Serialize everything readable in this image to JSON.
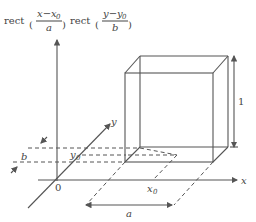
{
  "formula": {
    "func1": "rect",
    "num1": "x−x",
    "num1_sub": "0",
    "den1": "a",
    "func2": "rect",
    "num2": "y−y",
    "num2_sub": "0",
    "den2": "b"
  },
  "axes": {
    "x_label": "x",
    "y_label": "y",
    "origin_label": "0"
  },
  "labels": {
    "x0": "x",
    "x0_sub": "0",
    "y0": "y",
    "y0_sub": "0",
    "width_a": "a",
    "width_b": "b",
    "height": "1"
  },
  "colors": {
    "stroke": "#555555",
    "text": "#444444",
    "background": "#ffffff"
  }
}
